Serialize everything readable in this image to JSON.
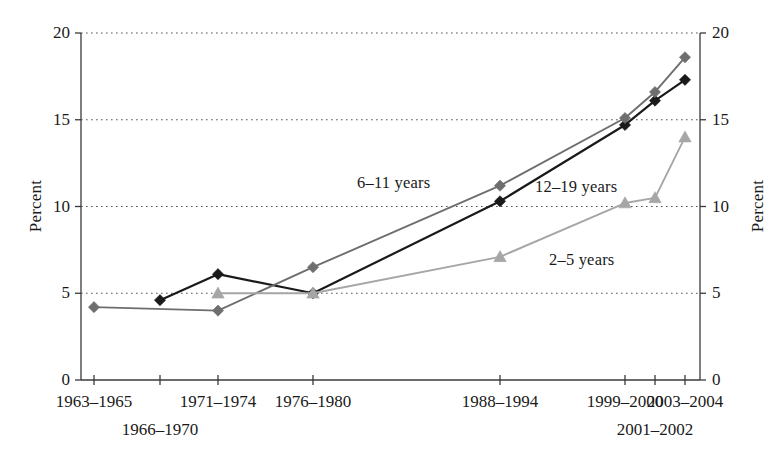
{
  "chart_data": {
    "type": "line",
    "title": "",
    "xlabel": "",
    "ylabel": "Percent",
    "ylabel_right": "Percent",
    "ylim": [
      0,
      20
    ],
    "yticks": [
      0,
      5,
      10,
      15,
      20
    ],
    "ytick_labels": [
      "0",
      "5",
      "10",
      "15",
      "20"
    ],
    "grid": true,
    "grid_style": "dotted",
    "legend_position": "inline-annotations",
    "categories": [
      "1963–1965",
      "1966–1970",
      "1971–1974",
      "1976–1980",
      "1988–1994",
      "1999–2000",
      "2001–2002",
      "2003–2004"
    ],
    "category_rows": [
      {
        "label": "1963–1965",
        "index": 0,
        "row": 0
      },
      {
        "label": "1966–1970",
        "index": 1,
        "row": 1
      },
      {
        "label": "1971–1974",
        "index": 2,
        "row": 0
      },
      {
        "label": "1976–1980",
        "index": 3,
        "row": 0
      },
      {
        "label": "1988–1994",
        "index": 4,
        "row": 0
      },
      {
        "label": "1999–2000",
        "index": 5,
        "row": 0
      },
      {
        "label": "2001–2002",
        "index": 6,
        "row": 1
      },
      {
        "label": "2003–2004",
        "index": 7,
        "row": 0
      }
    ],
    "series": [
      {
        "name": "6–11 years",
        "color": "#1a1a1a",
        "marker": "diamond",
        "values": [
          null,
          4.6,
          6.1,
          5.0,
          10.3,
          14.7,
          16.1,
          17.3
        ]
      },
      {
        "name": "12–19 years",
        "color": "#6e6e6e",
        "marker": "diamond",
        "values": [
          4.2,
          null,
          4.0,
          6.5,
          11.2,
          15.1,
          16.6,
          18.6
        ]
      },
      {
        "name": "2–5 years",
        "color": "#a6a6a6",
        "marker": "triangle",
        "values": [
          null,
          null,
          5.0,
          5.0,
          7.1,
          10.2,
          10.5,
          14.0
        ]
      }
    ],
    "annotations": [
      {
        "text": "6–11 years",
        "series": "6–11 years",
        "x_px": 357,
        "y_px": 173
      },
      {
        "text": "12–19 years",
        "series": "12–19 years",
        "x_px": 535,
        "y_px": 177
      },
      {
        "text": "2–5 years",
        "series": "2–5 years",
        "x_px": 549,
        "y_px": 250
      }
    ]
  },
  "colors": {
    "axis": "#3a3a3a",
    "grid": "#555555",
    "series_6_11": "#1a1a1a",
    "series_12_19": "#6e6e6e",
    "series_2_5": "#a6a6a6",
    "background": "#ffffff"
  }
}
